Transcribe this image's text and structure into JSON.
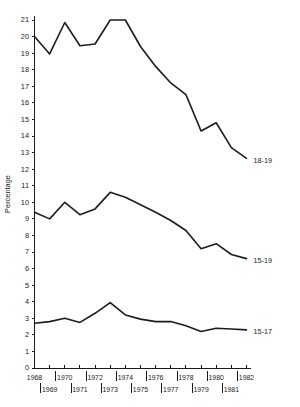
{
  "chart_data": {
    "type": "line",
    "title": "",
    "xlabel": "",
    "ylabel": "Percentage",
    "xlim": [
      1968,
      1982
    ],
    "ylim": [
      0,
      21
    ],
    "grid": false,
    "legend_position": "right-end-of-line",
    "yticks": [
      0,
      1,
      2,
      3,
      4,
      5,
      6,
      7,
      8,
      9,
      10,
      11,
      12,
      13,
      14,
      15,
      16,
      17,
      18,
      19,
      20,
      21
    ],
    "xticks": [
      1968,
      1969,
      1970,
      1971,
      1972,
      1973,
      1974,
      1975,
      1976,
      1977,
      1978,
      1979,
      1980,
      1981,
      1982
    ],
    "xtick_labels_top_row": [
      "1968",
      "1970",
      "1972",
      "1974",
      "1976",
      "1978",
      "1980",
      "1982"
    ],
    "xtick_labels_bottom_row": [
      "1969",
      "1971",
      "1973",
      "1975",
      "1977",
      "1979",
      "1981"
    ],
    "x": [
      1968,
      1969,
      1970,
      1971,
      1972,
      1973,
      1974,
      1975,
      1976,
      1977,
      1978,
      1979,
      1980,
      1981,
      1982
    ],
    "series": [
      {
        "name": "18-19",
        "label": "18-19",
        "color": "#1c1c1c",
        "values": [
          20.0,
          18.95,
          20.85,
          19.45,
          19.55,
          21.0,
          21.0,
          19.4,
          18.2,
          17.2,
          16.5,
          14.3,
          14.8,
          13.3,
          12.65
        ]
      },
      {
        "name": "15-19",
        "label": "15-19",
        "color": "#1c1c1c",
        "values": [
          9.4,
          9.0,
          10.0,
          9.25,
          9.6,
          10.6,
          10.3,
          9.85,
          9.4,
          8.9,
          8.3,
          7.2,
          7.5,
          6.85,
          6.6
        ]
      },
      {
        "name": "15-17",
        "label": "15-17",
        "color": "#1c1c1c",
        "values": [
          2.7,
          2.8,
          3.0,
          2.75,
          3.3,
          3.95,
          3.2,
          2.95,
          2.8,
          2.8,
          2.55,
          2.2,
          2.4,
          2.35,
          2.3
        ]
      }
    ]
  }
}
